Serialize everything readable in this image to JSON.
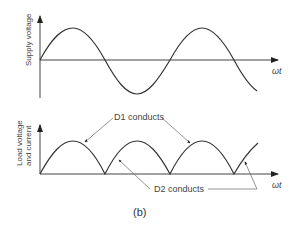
{
  "top_plot": {
    "ylabel": "Supply voltage",
    "xlabel": "ωt"
  },
  "bottom_plot": {
    "ylabel_line1": "Load voltage",
    "ylabel_line2": "and current",
    "xlabel": "ωt",
    "annotation_d1": "D1 conducts",
    "annotation_d2": "D2 conducts"
  },
  "caption": "(b)",
  "colors": {
    "line": "#333333"
  }
}
